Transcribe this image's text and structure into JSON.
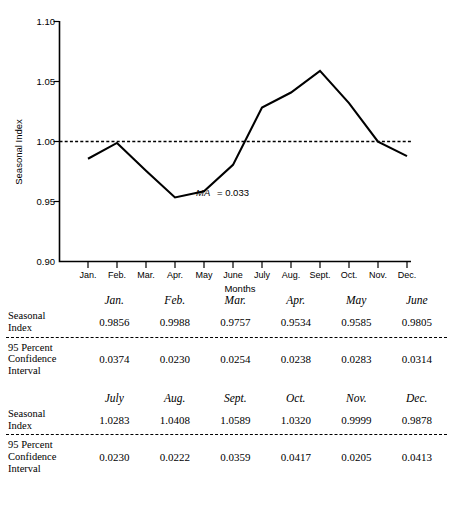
{
  "chart_data": {
    "type": "line",
    "title": "",
    "xlabel": "Months",
    "ylabel": "Seasonal Index",
    "ylim": [
      0.9,
      1.1
    ],
    "ytick_labels": [
      "1.10",
      "1.05",
      "1.00",
      "0.95",
      "0.90"
    ],
    "ytick_values": [
      1.1,
      1.05,
      1.0,
      0.95,
      0.9
    ],
    "grid": false,
    "legend": "none",
    "categories": [
      "Jan.",
      "Feb.",
      "Mar.",
      "Apr.",
      "May",
      "June",
      "July",
      "Aug.",
      "Sept.",
      "Oct.",
      "Nov.",
      "Dec."
    ],
    "series": [
      {
        "name": "Seasonal Index",
        "values": [
          0.9856,
          0.9988,
          0.9757,
          0.9534,
          0.9585,
          0.9805,
          1.0283,
          1.0408,
          1.0589,
          1.032,
          0.9999,
          0.9878
        ]
      }
    ],
    "reference_line": {
      "value": 1.0,
      "style": "dotted"
    },
    "annotations": [
      {
        "variable": "MA",
        "equals": "= 0.033",
        "value": 0.033
      }
    ]
  },
  "tables": [
    {
      "headers": [
        "Jan.",
        "Feb.",
        "Mar.",
        "Apr.",
        "May",
        "June"
      ],
      "rows": [
        {
          "label_lines": [
            "Seasonal",
            "Index"
          ],
          "values": [
            "0.9856",
            "0.9988",
            "0.9757",
            "0.9534",
            "0.9585",
            "0.9805"
          ]
        },
        {
          "label_lines": [
            "95 Percent",
            "Confidence",
            "Interval"
          ],
          "values": [
            "0.0374",
            "0.0230",
            "0.0254",
            "0.0238",
            "0.0283",
            "0.0314"
          ]
        }
      ]
    },
    {
      "headers": [
        "July",
        "Aug.",
        "Sept.",
        "Oct.",
        "Nov.",
        "Dec."
      ],
      "rows": [
        {
          "label_lines": [
            "Seasonal",
            "Index"
          ],
          "values": [
            "1.0283",
            "1.0408",
            "1.0589",
            "1.0320",
            "0.9999",
            "0.9878"
          ]
        },
        {
          "label_lines": [
            "95 Percent",
            "Confidence",
            "Interval"
          ],
          "values": [
            "0.0230",
            "0.0222",
            "0.0359",
            "0.0417",
            "0.0205",
            "0.0413"
          ]
        }
      ]
    }
  ],
  "colors": {
    "ink": "#000000",
    "background": "#ffffff"
  }
}
